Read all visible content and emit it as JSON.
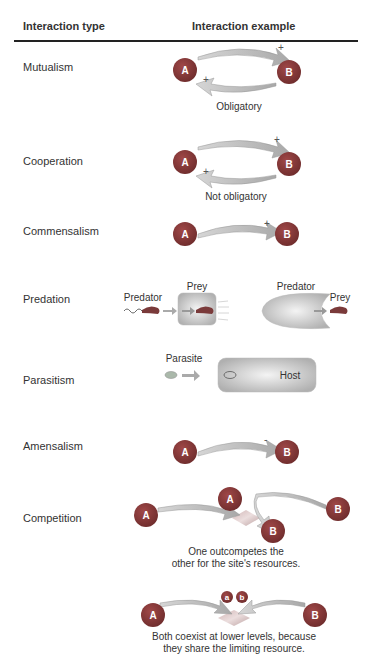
{
  "header": {
    "col1": "Interaction type",
    "col2": "Interaction example"
  },
  "rows": [
    {
      "type": "Mutualism",
      "node_a": "A",
      "node_b": "B",
      "sign_ab": "+",
      "sign_ba": "+",
      "caption": "Obligatory"
    },
    {
      "type": "Cooperation",
      "node_a": "A",
      "node_b": "B",
      "sign_ab": "+",
      "sign_ba": "+",
      "caption": "Not obligatory"
    },
    {
      "type": "Commensalism",
      "node_a": "A",
      "node_b": "B",
      "sign_ab": "+"
    },
    {
      "type": "Predation",
      "left_predator": "Predator",
      "left_prey": "Prey",
      "right_predator": "Predator",
      "right_prey": "Prey"
    },
    {
      "type": "Parasitism",
      "parasite": "Parasite",
      "host": "Host"
    },
    {
      "type": "Amensalism",
      "node_a": "A",
      "node_b": "B",
      "sign_ab": "-"
    },
    {
      "type": "Competition",
      "node_a": "A",
      "node_b": "B",
      "caption1_line1": "One outcompetes the",
      "caption1_line2": "other for the site's resources.",
      "small_a": "a",
      "small_b": "b",
      "caption2_line1": "Both coexist at lower levels, because",
      "caption2_line2": "they share the limiting resource."
    }
  ],
  "colors": {
    "node_fill": "#8a3a3a",
    "node_text": "#ffffff",
    "arrow_fill": "#c2c2c2",
    "text": "#333333",
    "rule": "#222222"
  }
}
